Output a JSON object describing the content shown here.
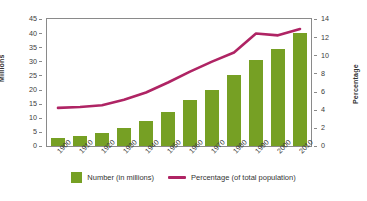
{
  "chart_data": {
    "type": "bar",
    "title": "",
    "subtitle": "",
    "xlabel": "",
    "ylabel": "Millions",
    "y2label": "Percentage",
    "categories": [
      "1900",
      "1910",
      "1920",
      "1930",
      "1940",
      "1950",
      "1960",
      "1970",
      "1980",
      "1990",
      "2000",
      "2010"
    ],
    "ylim": [
      0,
      45
    ],
    "y_ticks": [
      0,
      5,
      10,
      15,
      20,
      25,
      30,
      35,
      40,
      45
    ],
    "y2lim": [
      0,
      14
    ],
    "y2_ticks": [
      0,
      2,
      4,
      6,
      8,
      10,
      12,
      14
    ],
    "grid": false,
    "legend_position": "bottom",
    "series": [
      {
        "name": "Number (in millions)",
        "type": "bar",
        "axis": "left",
        "color": "#76a024",
        "values": [
          2.8,
          3.6,
          4.6,
          6.4,
          8.7,
          12.2,
          16.2,
          19.8,
          25.1,
          30.5,
          34.5,
          39.9
        ]
      },
      {
        "name": "Percentage (of total population)",
        "type": "line",
        "axis": "right",
        "color": "#af2464",
        "values": [
          4.2,
          4.3,
          4.5,
          5.1,
          5.9,
          7.0,
          8.2,
          9.3,
          10.3,
          12.4,
          12.2,
          12.9
        ]
      }
    ]
  },
  "legend": {
    "items": [
      {
        "label": "Number (in millions)",
        "swatch": "green-square-icon"
      },
      {
        "label": "Percentage (of total population)",
        "swatch": "magenta-line-icon"
      }
    ]
  },
  "axes": {
    "left_title": "Millions",
    "right_title": "Percentage"
  },
  "colors": {
    "bar": "#76a024",
    "line": "#af2464",
    "axis": "#8a8a8a",
    "text": "#3a3a3a",
    "background": "#ffffff"
  }
}
